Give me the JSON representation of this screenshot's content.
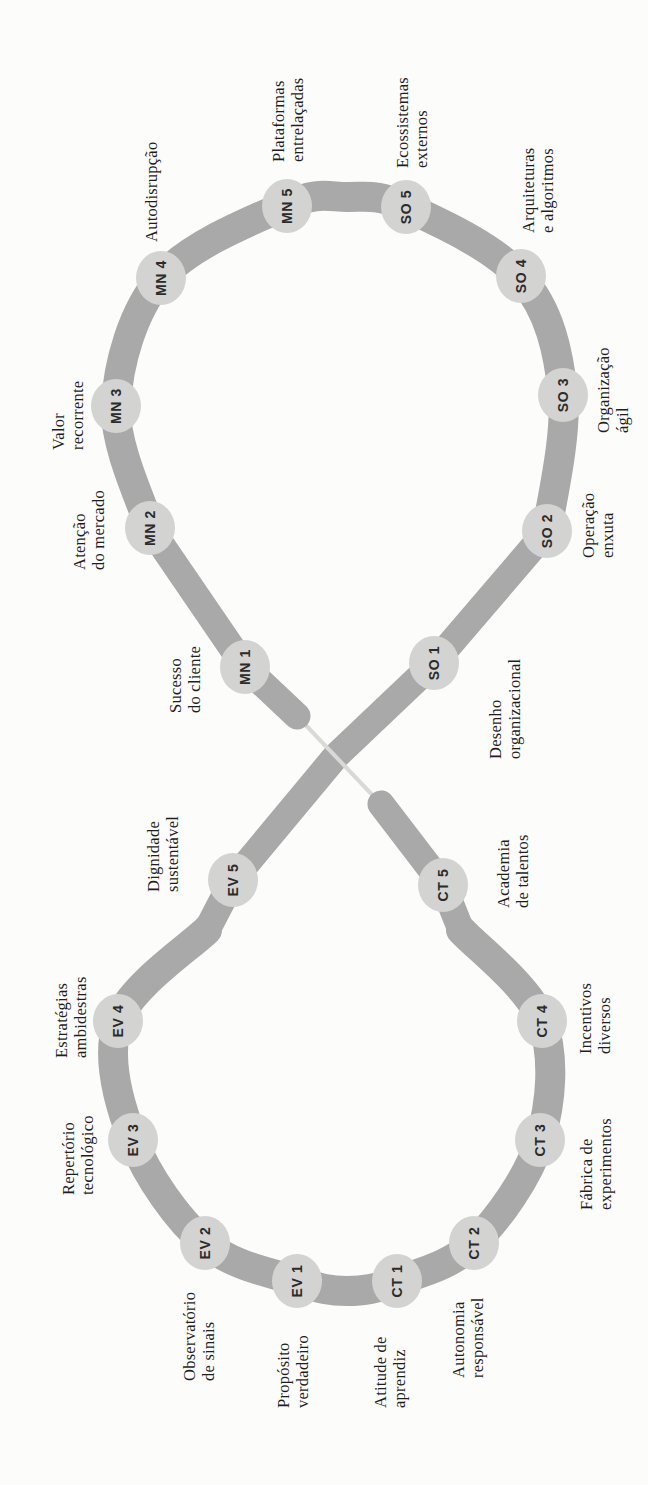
{
  "diagram": {
    "kind": "infinity-loop-figure-eight",
    "colors": {
      "background": "#fcfcfa",
      "track": "#a9a9a9",
      "node_fill": "#d3d3d1",
      "bridge": "#d9d9d6",
      "code_text": "#2b2b2b",
      "label_text": "#1e1e1e"
    },
    "nodes": [
      {
        "code": "MN 1",
        "label": "Sucesso\ndo cliente"
      },
      {
        "code": "MN 2",
        "label": "Atenção\ndo mercado"
      },
      {
        "code": "MN 3",
        "label": "Valor\nrecorrente"
      },
      {
        "code": "MN 4",
        "label": "Autodisrupção"
      },
      {
        "code": "MN 5",
        "label": "Plataformas\nentrelaçadas"
      },
      {
        "code": "SO 1",
        "label": "Desenho\norganizacional"
      },
      {
        "code": "SO 2",
        "label": "Operação\nenxuta"
      },
      {
        "code": "SO 3",
        "label": "Organização\nágil"
      },
      {
        "code": "SO 4",
        "label": "Arquiteturas\ne algoritmos"
      },
      {
        "code": "SO 5",
        "label": "Ecossistemas\nexternos"
      },
      {
        "code": "EV 1",
        "label": "Propósito\nverdadeiro"
      },
      {
        "code": "EV 2",
        "label": "Observatório\nde sinais"
      },
      {
        "code": "EV 3",
        "label": "Repertório\ntecnológico"
      },
      {
        "code": "EV 4",
        "label": "Estratégias\nambidestras"
      },
      {
        "code": "EV 5",
        "label": "Dignidade\nsustentável"
      },
      {
        "code": "CT 1",
        "label": "Atitude de\naprendiz"
      },
      {
        "code": "CT 2",
        "label": "Autonomia\nresponsável"
      },
      {
        "code": "CT 3",
        "label": "Fábrica de\nexperimentos"
      },
      {
        "code": "CT 4",
        "label": "Incentivos\ndiversos"
      },
      {
        "code": "CT 5",
        "label": "Academia\nde talentos"
      }
    ]
  }
}
